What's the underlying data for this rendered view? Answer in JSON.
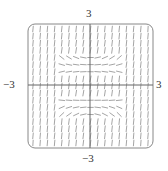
{
  "diagram": {
    "type": "slope_field",
    "title": "",
    "x_range": [
      -3,
      3
    ],
    "y_range": [
      -3,
      3
    ],
    "tick_labels": {
      "top": "3",
      "bottom": "−3",
      "left": "−3",
      "right": "3"
    },
    "grid": {
      "cols": 17,
      "rows": 17
    },
    "colors": {
      "frame": "#888888",
      "axes": "#666666",
      "segments": "#9a9a9a"
    }
  }
}
